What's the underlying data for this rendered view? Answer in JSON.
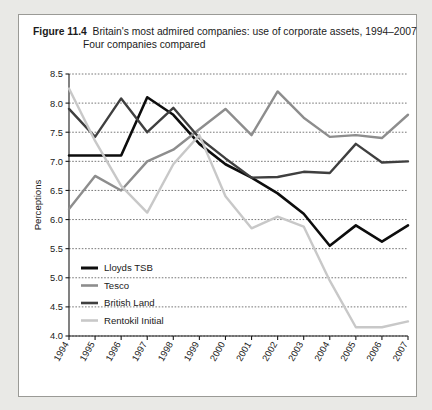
{
  "figure": {
    "label": "Figure 11.4",
    "caption": "Britain's most admired companies: use of corporate assets, 1994–2007",
    "subcaption": "Four companies compared"
  },
  "chart_data": {
    "type": "line",
    "title": "Britain's most admired companies: use of corporate assets, 1994–2007",
    "subtitle": "Four companies compared",
    "xlabel": "",
    "ylabel": "Perceptions",
    "x": [
      "1994",
      "1995",
      "1996",
      "1997",
      "1998",
      "1999",
      "2000",
      "2001",
      "2002",
      "2003",
      "2004",
      "2005",
      "2006",
      "2007"
    ],
    "ylim": [
      4.0,
      8.5
    ],
    "yticks": [
      "4.0",
      "4.5",
      "5.0",
      "5.5",
      "6.0",
      "6.5",
      "7.0",
      "7.5",
      "8.0",
      "8.5"
    ],
    "grid": true,
    "legend_position": "bottom-left",
    "series": [
      {
        "name": "Lloyds TSB",
        "color": "#0d0d0d",
        "width": 2.6,
        "values": [
          7.1,
          7.1,
          7.1,
          8.1,
          7.8,
          7.3,
          6.95,
          6.72,
          6.45,
          6.1,
          5.55,
          5.9,
          5.62,
          5.9
        ]
      },
      {
        "name": "Tesco",
        "color": "#8d8d8d",
        "width": 2.4,
        "values": [
          6.18,
          6.75,
          6.5,
          7.0,
          7.2,
          7.55,
          7.9,
          7.45,
          8.2,
          7.75,
          7.42,
          7.45,
          7.4,
          7.8
        ]
      },
      {
        "name": "British Land",
        "color": "#3f3f3f",
        "width": 2.4,
        "values": [
          7.9,
          7.42,
          8.08,
          7.5,
          7.92,
          7.4,
          7.05,
          6.72,
          6.73,
          6.82,
          6.8,
          7.3,
          6.98,
          7.0
        ]
      },
      {
        "name": "Rentokil Initial",
        "color": "#c8c8c8",
        "width": 2.4,
        "values": [
          8.25,
          7.35,
          6.58,
          6.12,
          6.95,
          7.45,
          6.4,
          5.85,
          6.05,
          5.88,
          4.95,
          4.15,
          4.15,
          4.25
        ]
      }
    ]
  },
  "legend": {
    "items": [
      {
        "label": "Lloyds TSB",
        "color": "#0d0d0d"
      },
      {
        "label": "Tesco",
        "color": "#8d8d8d"
      },
      {
        "label": "British Land",
        "color": "#3f3f3f"
      },
      {
        "label": "Rentokil Initial",
        "color": "#c8c8c8"
      }
    ]
  }
}
